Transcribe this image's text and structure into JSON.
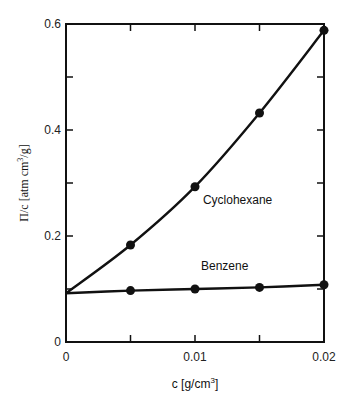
{
  "chart_data": {
    "type": "line",
    "title": "",
    "xlabel": "c [g/cm³]",
    "ylabel": "Π/c [atm cm³/g]",
    "xlim": [
      0,
      0.02
    ],
    "ylim": [
      0,
      0.6
    ],
    "x_ticks": [
      {
        "value": 0,
        "label": "0"
      },
      {
        "value": 0.005,
        "label": ""
      },
      {
        "value": 0.01,
        "label": "0.01"
      },
      {
        "value": 0.015,
        "label": ""
      },
      {
        "value": 0.02,
        "label": "0.02"
      }
    ],
    "y_ticks": [
      {
        "value": 0,
        "label": "0"
      },
      {
        "value": 0.1,
        "label": ""
      },
      {
        "value": 0.2,
        "label": "0.2"
      },
      {
        "value": 0.3,
        "label": ""
      },
      {
        "value": 0.4,
        "label": "0.4"
      },
      {
        "value": 0.5,
        "label": ""
      },
      {
        "value": 0.6,
        "label": "0.6"
      }
    ],
    "grid": false,
    "legend": "inline labels",
    "x": [
      0.005,
      0.01,
      0.015,
      0.02
    ],
    "series": [
      {
        "name": "Cyclohexane",
        "intercept": 0.092,
        "values": [
          0.183,
          0.293,
          0.432,
          0.588
        ],
        "label_position": {
          "x": 0.0133,
          "y": 0.26
        }
      },
      {
        "name": "Benzene",
        "intercept": 0.092,
        "values": [
          0.097,
          0.1,
          0.103,
          0.108
        ],
        "label_position": {
          "x": 0.0123,
          "y": 0.135
        }
      }
    ]
  },
  "labels": {
    "xlabel_main": "c [g/cm",
    "xlabel_sup": "3",
    "xlabel_end": "]",
    "ylabel_main": "Π/c [atm cm",
    "ylabel_sup": "3",
    "ylabel_end": "/g]"
  }
}
